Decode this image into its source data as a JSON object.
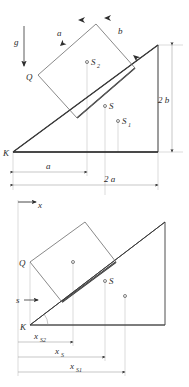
{
  "figure": {
    "background_color": "#ffffff",
    "line_color": "#3a3a3a",
    "thin_line_color": "#b4b4b4"
  },
  "upper_diagram": {
    "name": "upper-diagram",
    "labels": {
      "gravity": "g",
      "vertex_K": "K",
      "corner_Q": "Q",
      "side_a": "a",
      "side_b": "b",
      "centroid_block": "S",
      "centroid_block_sub": "2",
      "centroid_total": "S",
      "centroid_wedge": "S",
      "centroid_wedge_sub": "1",
      "height_2b": "2 b",
      "base_a": "a",
      "base_2a": "2 a"
    },
    "points": [
      {
        "name": "S2",
        "label": "S",
        "sub": "2",
        "x": 87,
        "y": 62
      },
      {
        "name": "S",
        "label": "S",
        "sub": "",
        "x": 105,
        "y": 106
      },
      {
        "name": "S1",
        "label": "S",
        "sub": "1",
        "x": 118,
        "y": 121
      }
    ],
    "geometry": {
      "K": [
        13,
        152
      ],
      "apex": [
        158,
        45
      ],
      "base_right": [
        158,
        152
      ],
      "rect_Q": [
        38,
        75
      ],
      "rect_top": [
        96,
        24
      ],
      "rect_right": [
        135,
        68
      ],
      "rect_bottom": [
        77,
        118
      ]
    },
    "dimensions": [
      {
        "name": "a",
        "label": "a",
        "from_x": 13,
        "to_x": 87,
        "y": 172
      },
      {
        "name": "2a",
        "label": "2 a",
        "from_x": 13,
        "to_x": 158,
        "y": 185
      },
      {
        "name": "2b",
        "label": "2 b",
        "x": 172,
        "from_y": 45,
        "to_y": 152
      }
    ]
  },
  "lower_diagram": {
    "name": "lower-diagram",
    "labels": {
      "axis_x": "x",
      "axis_s": "s",
      "vertex_K": "K",
      "corner_Q": "Q",
      "centroid_total": "S"
    },
    "points": [
      {
        "name": "S2",
        "label": "",
        "sub": "",
        "x": 73,
        "y": 262
      },
      {
        "name": "S",
        "label": "S",
        "sub": "",
        "x": 105,
        "y": 281
      },
      {
        "name": "S1",
        "label": "",
        "sub": "",
        "x": 125,
        "y": 296
      }
    ],
    "geometry": {
      "K": [
        30,
        325
      ],
      "apex": [
        165,
        222
      ],
      "base_right": [
        165,
        325
      ],
      "rect_Q": [
        30,
        262
      ],
      "rect_top": [
        85,
        222
      ],
      "rect_right": [
        116,
        262
      ],
      "rect_bottom": [
        62,
        302
      ]
    },
    "dimensions": [
      {
        "name": "xS2",
        "label": "x",
        "sub": "S2",
        "from_x": 18,
        "to_x": 73,
        "y": 342
      },
      {
        "name": "xS",
        "label": "x",
        "sub": "S",
        "from_x": 18,
        "to_x": 105,
        "y": 357
      },
      {
        "name": "xS1",
        "label": "x",
        "sub": "S1",
        "from_x": 18,
        "to_x": 125,
        "y": 372
      }
    ]
  }
}
